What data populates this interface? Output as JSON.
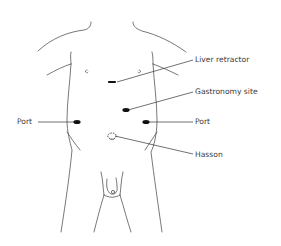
{
  "diagram": {
    "type": "anatomical-port-placement",
    "labels": {
      "liver_retractor": "Liver retractor",
      "gastronomy_site": "Gastronomy site",
      "port_left": "Port",
      "port_right": "Port",
      "hasson": "Hasson"
    },
    "colors": {
      "outline": "#555555",
      "marker": "#111111",
      "text": "#3a3a3a"
    }
  }
}
